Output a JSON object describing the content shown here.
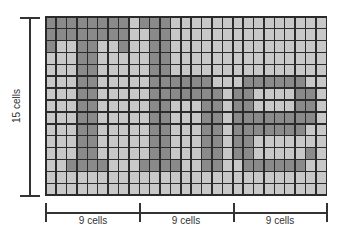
{
  "diagram": {
    "rows": 15,
    "cols": 27,
    "colors": {
      "dark": "#8a8a8a",
      "light": "#c8c8c8",
      "gridline": "#2b2b2b"
    },
    "dark_cells": [
      [
        0,
        1,
        2,
        3,
        4,
        5,
        6,
        7,
        9,
        10,
        11
      ],
      [
        0,
        1,
        2,
        3,
        4,
        5,
        6,
        7,
        10,
        11
      ],
      [
        0,
        3,
        4,
        7,
        10,
        11
      ],
      [
        3,
        4,
        10,
        11
      ],
      [
        3,
        4,
        10,
        11
      ],
      [
        3,
        4,
        10,
        11,
        12,
        13,
        14,
        15,
        19,
        20,
        21,
        22,
        23,
        24
      ],
      [
        3,
        4,
        10,
        11,
        12,
        13,
        14,
        15,
        16,
        18,
        19,
        24,
        25
      ],
      [
        3,
        4,
        10,
        11,
        15,
        16,
        18,
        19,
        24,
        25
      ],
      [
        3,
        4,
        10,
        11,
        15,
        16,
        18,
        19,
        20,
        21,
        22,
        23,
        24,
        25
      ],
      [
        3,
        4,
        10,
        11,
        15,
        16,
        18,
        19,
        20,
        21,
        22,
        23,
        24
      ],
      [
        3,
        4,
        10,
        11,
        15,
        16,
        18,
        19
      ],
      [
        3,
        4,
        10,
        11,
        15,
        16,
        18,
        19,
        25
      ],
      [
        2,
        3,
        4,
        5,
        9,
        10,
        11,
        12,
        15,
        16,
        19,
        20,
        21,
        22,
        23,
        24
      ],
      [],
      []
    ]
  },
  "axes": {
    "vertical_label": "15 cells",
    "horizontal_segments": [
      {
        "label": "9 cells"
      },
      {
        "label": "9 cells"
      },
      {
        "label": "9 cells"
      }
    ]
  }
}
